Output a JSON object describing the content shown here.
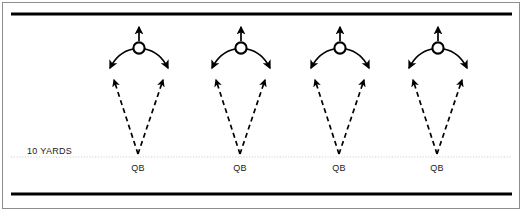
{
  "diagram": {
    "type": "play-diagram",
    "canvas": {
      "width": 525,
      "height": 214
    },
    "colors": {
      "line": "#000000",
      "frame": "#8d8d8d",
      "yard_line": "#cfcfcf",
      "text": "#1a1a1a",
      "background": "#ffffff"
    },
    "boundary_lines": [
      {
        "name": "top-sideline",
        "y": 14,
        "x1": 11,
        "x2": 512,
        "thickness": 3
      },
      {
        "name": "bottom-sideline",
        "y": 194,
        "x1": 11,
        "x2": 512,
        "thickness": 3
      }
    ],
    "yard_line": {
      "label": "10 YARDS",
      "label_x": 27,
      "label_y": 147,
      "y": 157,
      "x1": 11,
      "x2": 512,
      "style": "dotted"
    },
    "units": [
      {
        "id": 1,
        "qb_label": "QB",
        "qb_x": 138,
        "receiver_x": 139
      },
      {
        "id": 2,
        "qb_label": "QB",
        "qb_x": 240,
        "receiver_x": 241
      },
      {
        "id": 3,
        "qb_label": "QB",
        "qb_x": 339,
        "receiver_x": 340
      },
      {
        "id": 4,
        "qb_label": "QB",
        "qb_x": 437,
        "receiver_x": 438
      }
    ],
    "geometry": {
      "receiver_cy": 48,
      "receiver_radius": 6,
      "qb_y": 156,
      "qb_label_y": 164,
      "route_arrow_top_y": 76,
      "route_arrow_dx": 26,
      "release_arrow_dx": 34,
      "release_arrow_y": 66,
      "up_arrow_top_y": 24
    },
    "symbols": {
      "receiver": "O",
      "quarterback": "QB"
    }
  }
}
